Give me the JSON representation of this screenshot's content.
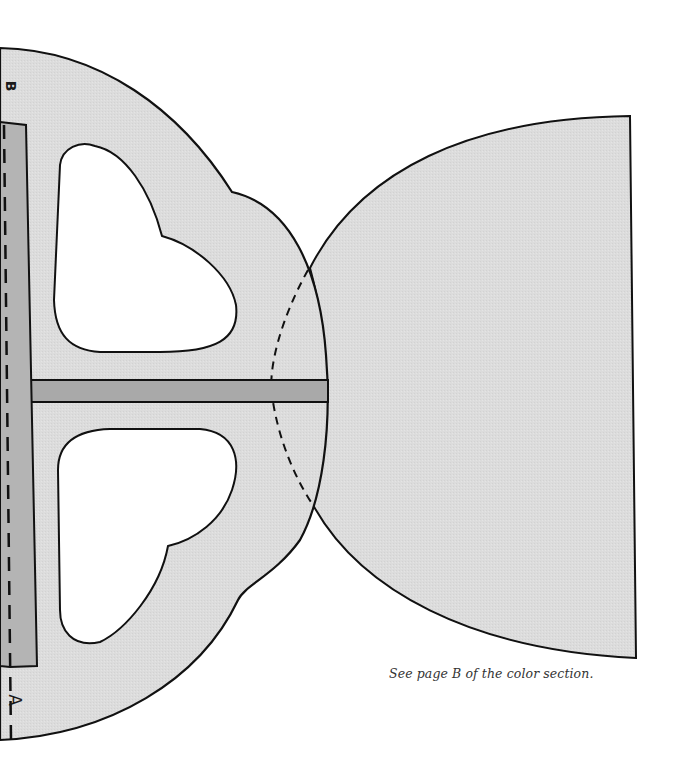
{
  "page": {
    "caption": "See page B of the color section."
  },
  "pattern": {
    "labels": {
      "top_label": "B",
      "bottom_label": "A"
    },
    "colors": {
      "fill_light": "#dcdcdc",
      "fill_strip": "#a9a9a9",
      "fill_tab": "#bdbdbd",
      "outline": "#111111",
      "cutout": "#ffffff",
      "background": "#ffffff"
    },
    "pieces": [
      {
        "name": "left-piece-with-heart-cutouts",
        "description": "Scalloped half-round piece with two heart-shaped cutouts"
      },
      {
        "name": "right-half-circle-piece",
        "description": "Half-round piece with straight right edge"
      },
      {
        "name": "center-strip",
        "description": "Horizontal dark strip connecting pieces"
      },
      {
        "name": "left-vertical-tab",
        "description": "Dark vertical glue tab along left dashed fold line"
      }
    ],
    "lines": {
      "left_fold": "dashed",
      "center_overlap_arc": "dashed"
    }
  }
}
